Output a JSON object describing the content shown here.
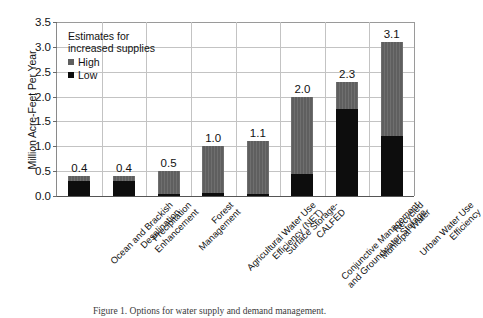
{
  "chart_data": {
    "type": "bar",
    "title": "",
    "subtitle": "",
    "xlabel": "",
    "ylabel": "Million Acre-Feet Per Year",
    "ylim": [
      0.0,
      3.5
    ],
    "yticks": [
      "0.0",
      "0.5",
      "1.0",
      "1.5",
      "2.0",
      "2.5",
      "3.0",
      "3.5"
    ],
    "ytick_values": [
      0.0,
      0.5,
      1.0,
      1.5,
      2.0,
      2.5,
      3.0,
      3.5
    ],
    "grid": "horizontal-and-vertical",
    "legend_position": "upper-left-inside",
    "legend_title": "Estimates for increased supplies",
    "stacked": true,
    "categories": [
      "Ocean and Brackish Desalination",
      "Precipitation Enhancement",
      "Forest Management",
      "Agricultural Water Use Efficiency (NET)",
      "Surface Storage- CALFED",
      "Conjunctive Management and Groundwater Storage",
      "Recycled Municipal Water",
      "Urban Water Use Efficiency"
    ],
    "series": [
      {
        "name": "Low",
        "color": "#0d0d0d",
        "values": [
          0.3,
          0.3,
          0.05,
          0.07,
          0.05,
          0.45,
          1.75,
          1.2
        ]
      },
      {
        "name": "High",
        "color": "#5f5f5f",
        "values": [
          0.4,
          0.4,
          0.5,
          1.0,
          1.1,
          2.0,
          2.3,
          3.1
        ]
      }
    ],
    "data_labels": [
      "0.4",
      "0.4",
      "0.5",
      "1.0",
      "1.1",
      "2.0",
      "2.3",
      "3.1"
    ]
  },
  "legend": {
    "title_line1": "Estimates for",
    "title_line2": "increased supplies",
    "items": [
      {
        "label": "High",
        "color": "#5f5f5f"
      },
      {
        "label": "Low",
        "color": "#0d0d0d"
      }
    ]
  },
  "axis": {
    "y_title": "Million Acre-Feet Per Year"
  },
  "category_labels": [
    {
      "line1": "Ocean and Brackish",
      "line2": "Desalination"
    },
    {
      "line1": "Precipitation",
      "line2": "Enhancement"
    },
    {
      "line1": "Forest",
      "line2": "Management"
    },
    {
      "line1": "Agricultural Water Use",
      "line2": "Efficiency (NET)"
    },
    {
      "line1": "Surface Storage-",
      "line2": "CALFED"
    },
    {
      "line1": "Conjunctive Management",
      "line2": "and Groundwater Storage"
    },
    {
      "line1": "Recycled",
      "line2": "Municipal Water"
    },
    {
      "line1": "Urban Water Use",
      "line2": "Efficiency"
    }
  ],
  "caption": {
    "text": "Figure 1. Options for water supply and demand management."
  }
}
